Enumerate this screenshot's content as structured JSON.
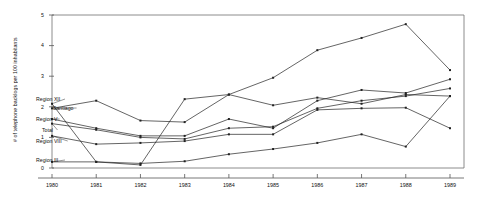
{
  "chart_data": {
    "type": "line",
    "title": "",
    "xlabel": "",
    "ylabel": "# of telephone backlogs per 100 inhabitants",
    "x": [
      1980,
      1981,
      1982,
      1983,
      1984,
      1985,
      1986,
      1987,
      1988,
      1989
    ],
    "categories": [
      "1980",
      "1981",
      "1982",
      "1983",
      "1984",
      "1985",
      "1986",
      "1987",
      "1988",
      "1989"
    ],
    "xlim": [
      1980,
      1989
    ],
    "ylim": [
      0,
      5
    ],
    "yticks": [
      0,
      1,
      2,
      3,
      4,
      5
    ],
    "ytick_labels": [
      "0",
      "1",
      "2",
      "3",
      "4",
      "5"
    ],
    "grid": false,
    "legend": "inline-left-labels",
    "markers": true,
    "line_color": "#222222",
    "series": [
      {
        "name": "Santiago",
        "label": "Santiago",
        "values": [
          1.95,
          2.2,
          1.55,
          1.5,
          2.4,
          2.95,
          3.85,
          4.25,
          4.7,
          3.2
        ]
      },
      {
        "name": "Region XII",
        "label": "Region XII",
        "values": [
          2.1,
          0.2,
          0.1,
          2.25,
          2.4,
          2.05,
          2.3,
          2.1,
          2.4,
          2.35
        ]
      },
      {
        "name": "Region V",
        "label": "Region V",
        "values": [
          1.6,
          1.3,
          1.05,
          1.05,
          1.6,
          1.3,
          2.2,
          2.55,
          2.45,
          2.9
        ]
      },
      {
        "name": "Total",
        "label": "Total",
        "values": [
          1.45,
          1.25,
          1.0,
          0.95,
          1.3,
          1.35,
          1.95,
          2.2,
          2.35,
          2.6
        ]
      },
      {
        "name": "Region VIII",
        "label": "Region VIII",
        "values": [
          1.05,
          0.78,
          0.82,
          0.88,
          1.1,
          1.1,
          1.9,
          1.95,
          1.97,
          1.3
        ]
      },
      {
        "name": "Region III",
        "label": "Region III",
        "values": [
          0.2,
          0.2,
          0.15,
          0.22,
          0.45,
          0.62,
          0.82,
          1.1,
          0.7,
          2.35
        ]
      }
    ],
    "series_label_anchors": [
      {
        "name": "Region XII",
        "lx": 36,
        "ly": 99
      },
      {
        "name": "Santiago",
        "lx": 53,
        "ly": 108
      },
      {
        "name": "Region V",
        "lx": 36,
        "ly": 119
      },
      {
        "name": "Total",
        "lx": 42,
        "ly": 130
      },
      {
        "name": "Region VIII",
        "lx": 36,
        "ly": 141
      },
      {
        "name": "Region III",
        "lx": 36,
        "ly": 160
      }
    ]
  }
}
